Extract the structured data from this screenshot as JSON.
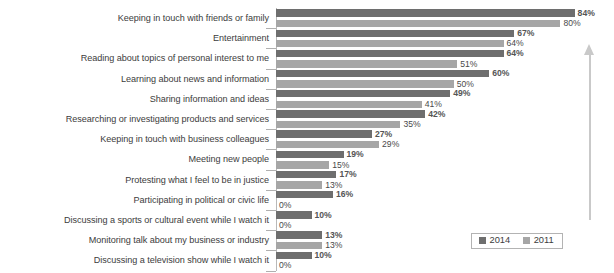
{
  "chart_data": {
    "type": "bar",
    "orientation": "horizontal",
    "title": "",
    "subtitle": "",
    "xlabel": "",
    "ylabel": "",
    "xlim": [
      0,
      90
    ],
    "grid": false,
    "legend_position": "bottom-right",
    "value_suffix": "%",
    "categories": [
      "Keeping in touch with friends or family",
      "Entertainment",
      "Reading about topics of personal interest to me",
      "Learning about news and information",
      "Sharing information and ideas",
      "Researching or investigating products and services",
      "Keeping in touch with business colleagues",
      "Meeting new people",
      "Protesting what I feel to be in justice",
      "Participating in political or civic life",
      "Discussing a sports or cultural event while I watch it",
      "Monitoring talk about my business or industry",
      "Discussing a television show while I watch it"
    ],
    "series": [
      {
        "name": "2014",
        "color": "#6e6e6e",
        "values": [
          84,
          67,
          64,
          60,
          49,
          42,
          27,
          19,
          17,
          16,
          10,
          13,
          10
        ],
        "labels": [
          "84%",
          "67%",
          "64%",
          "60%",
          "49%",
          "42%",
          "27%",
          "19%",
          "17%",
          "16%",
          "10%",
          "13%",
          "10%"
        ]
      },
      {
        "name": "2011",
        "color": "#a6a6a6",
        "values": [
          80,
          64,
          51,
          50,
          41,
          35,
          29,
          15,
          13,
          0,
          0,
          13,
          0
        ],
        "labels": [
          "80%",
          "64%",
          "51%",
          "50%",
          "41%",
          "35%",
          "29%",
          "15%",
          "13%",
          "0%",
          "0%",
          "13%",
          "0%"
        ]
      }
    ]
  },
  "legend": {
    "entries": [
      {
        "label": "2014",
        "color": "#6e6e6e"
      },
      {
        "label": "2011",
        "color": "#a6a6a6"
      }
    ]
  },
  "annotations": {
    "trend_arrow": {
      "icon": "up-arrow-icon",
      "direction": "up",
      "color": "#c9c9c9"
    }
  }
}
